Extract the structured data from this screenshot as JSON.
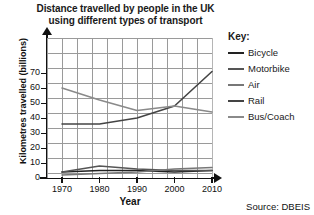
{
  "chart_data": {
    "type": "line",
    "title": "Distance travelled by people in the UK using different types of transport",
    "title_line1": "Distance travelled by people in the UK",
    "title_line2": "using different types of transport",
    "xlabel": "Year",
    "ylabel": "Kilometres travelled (billions)",
    "x": [
      1970,
      1980,
      1990,
      2000,
      2010
    ],
    "xtick_labels": [
      "1970",
      "1980",
      "1990",
      "2000",
      "2010"
    ],
    "ytick_labels": [
      "0",
      "10",
      "20",
      "30",
      "40",
      "50",
      "60",
      "70"
    ],
    "xlim": [
      1970,
      2010
    ],
    "ylim": [
      0,
      75
    ],
    "grid": true,
    "legend_title": "Key:",
    "legend_position": "right",
    "source": "Source: DBEIS",
    "series": [
      {
        "name": "Bicycle",
        "color": "#222222",
        "values": [
          4,
          5,
          5,
          4,
          5
        ]
      },
      {
        "name": "Motorbike",
        "color": "#555555",
        "values": [
          4,
          8,
          6,
          5,
          5
        ]
      },
      {
        "name": "Air",
        "color": "#777777",
        "values": [
          2,
          3,
          4,
          6,
          7
        ]
      },
      {
        "name": "Rail",
        "color": "#444444",
        "values": [
          36,
          36,
          40,
          48,
          71
        ]
      },
      {
        "name": "Bus/Coach",
        "color": "#8a8a8a",
        "values": [
          60,
          52,
          45,
          48,
          44
        ]
      }
    ]
  },
  "ticks": {
    "y": [
      {
        "label": "70",
        "value": 70
      },
      {
        "label": "60",
        "value": 60
      },
      {
        "label": "50",
        "value": 50
      },
      {
        "label": "40",
        "value": 40
      },
      {
        "label": "30",
        "value": 30
      },
      {
        "label": "20",
        "value": 20
      },
      {
        "label": "10",
        "value": 10
      },
      {
        "label": "0",
        "value": 0
      }
    ]
  }
}
